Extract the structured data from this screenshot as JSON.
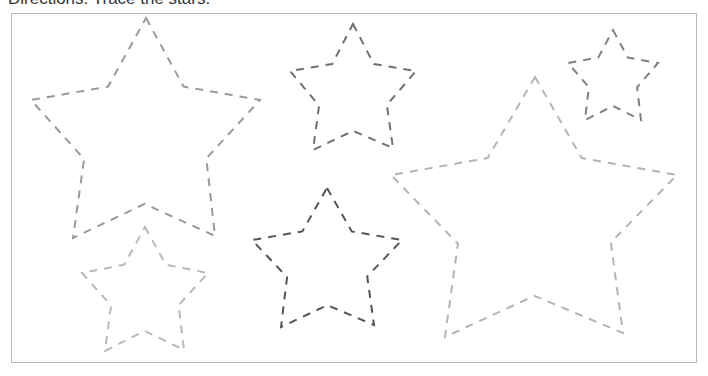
{
  "worksheet": {
    "directions": "Directions: Trace the stars.",
    "frame_border_color": "#b8b8b8"
  },
  "stars": [
    {
      "id": "star-large-left",
      "color": "#9a9a9a",
      "cx": 146,
      "cy": 140,
      "outer_points": [
        [
          146,
          18
        ],
        [
          260,
          100
        ],
        [
          215,
          236
        ],
        [
          73,
          238
        ],
        [
          31,
          100
        ]
      ]
    },
    {
      "id": "star-medium-top",
      "color": "#707070",
      "cx": 353,
      "cy": 96,
      "outer_points": [
        [
          353,
          24
        ],
        [
          416,
          71
        ],
        [
          393,
          148
        ],
        [
          313,
          150
        ],
        [
          290,
          71
        ]
      ]
    },
    {
      "id": "star-small-top-right",
      "color": "#808080",
      "cx": 613,
      "cy": 79,
      "outer_points": [
        [
          613,
          30
        ],
        [
          658,
          63
        ],
        [
          641,
          120
        ],
        [
          585,
          120
        ],
        [
          568,
          63
        ]
      ]
    },
    {
      "id": "star-large-right",
      "color": "#b4b4b4",
      "cx": 535,
      "cy": 220,
      "outer_points": [
        [
          535,
          77
        ],
        [
          677,
          175
        ],
        [
          623,
          333
        ],
        [
          445,
          337
        ],
        [
          391,
          175
        ]
      ]
    },
    {
      "id": "star-small-bottom-left",
      "color": "#b8b8b8",
      "cx": 145,
      "cy": 293,
      "outer_points": [
        [
          145,
          227
        ],
        [
          208,
          273
        ],
        [
          184,
          350
        ],
        [
          105,
          351
        ],
        [
          82,
          273
        ]
      ]
    },
    {
      "id": "star-medium-bottom",
      "color": "#555555",
      "cx": 327,
      "cy": 265,
      "outer_points": [
        [
          327,
          188
        ],
        [
          402,
          240
        ],
        [
          374,
          325
        ],
        [
          281,
          327
        ],
        [
          252,
          240
        ]
      ]
    }
  ]
}
